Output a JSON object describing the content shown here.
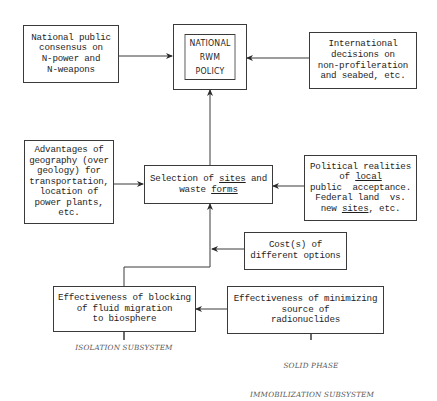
{
  "diagram": {
    "center": {
      "title_lines": [
        "NATIONAL",
        "RWM",
        "POLICY"
      ]
    },
    "boxes": {
      "national_consensus": [
        "National public",
        "consensus on",
        "N-power and",
        "N-weapons"
      ],
      "international": [
        "International",
        "decisions on",
        "non-profileration",
        "and seabed, etc."
      ],
      "geography": [
        "Advantages of",
        "geography (over",
        "geology) for",
        "transportation,",
        "location of",
        "power plants,",
        "etc."
      ],
      "selection": [
        "Selection of sites and",
        "waste forms"
      ],
      "political": [
        "Political realities",
        "of local",
        "public  acceptance.",
        "Federal land  vs.",
        "new sites, etc."
      ],
      "cost": [
        "Cost(s) of",
        "different options"
      ],
      "blocking": [
        "Effectiveness of blocking",
        "of fluid migration",
        "to biosphere"
      ],
      "minimizing": [
        "Effectiveness of minimizing",
        "source of",
        "radionuclides"
      ]
    },
    "captions": {
      "isolation": "ISOLATION SUBSYSTEM",
      "solid_phase": [
        "SOLID PHASE",
        "IMMOBILIZATION SUBSYSTEM"
      ]
    },
    "underlined_words": [
      "sites",
      "forms",
      "local"
    ],
    "colors": {
      "line": "#3a3a3a",
      "text": "#1e1e1e",
      "caption": "#555555",
      "background": "#ffffff"
    }
  }
}
